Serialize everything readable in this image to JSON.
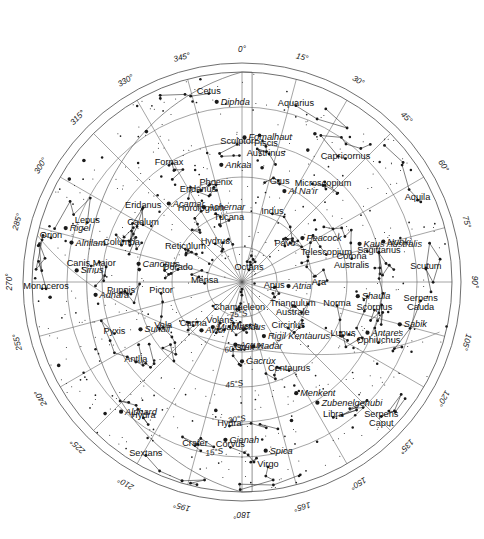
{
  "chart_data": {
    "type": "scatter",
    "projection": "polar-azimuthal-equidistant",
    "center": "South Celestial Pole (Octans)",
    "xlabel": "Right Ascension (degrees)",
    "ylabel": "Declination (degrees South)",
    "grid": true,
    "legend": false,
    "ra_ticks_deg": [
      0,
      15,
      30,
      45,
      60,
      75,
      90,
      105,
      120,
      135,
      150,
      165,
      180,
      195,
      210,
      225,
      240,
      255,
      270,
      285,
      300,
      315,
      330,
      345
    ],
    "ra_tick_labels": [
      "0°",
      "15°",
      "30°",
      "45°",
      "60°",
      "75°",
      "90°",
      "105°",
      "120°",
      "135°",
      "150°",
      "165°",
      "180°",
      "195°",
      "210°",
      "225°",
      "240°",
      "255°",
      "270°",
      "285°",
      "300°",
      "315°",
      "330°",
      "345°"
    ],
    "dec_rings_deg": [
      0,
      15,
      30,
      45,
      60,
      75
    ],
    "dec_tick_labels": [
      "0°",
      "15°S",
      "30°S",
      "45°S",
      "60°S",
      "75°S"
    ],
    "dec_label_positions": [
      {
        "label": "75°S",
        "ra": 185,
        "dec": -75
      },
      {
        "label": "60°S",
        "ra": 187,
        "dec": -60
      },
      {
        "label": "45°S",
        "ra": 184,
        "dec": -45
      },
      {
        "label": "30°S",
        "ra": 182,
        "dec": -30
      },
      {
        "label": "15°S",
        "ra": 189,
        "dec": -15
      }
    ],
    "constellations": [
      {
        "name": "Cetus",
        "ra": 350,
        "dec": -8
      },
      {
        "name": "Sculptor",
        "ra": 358,
        "dec": -31
      },
      {
        "name": "Fornax",
        "ra": 328,
        "dec": -31
      },
      {
        "name": "Eridanus",
        "ra": 307,
        "dec": -37
      },
      {
        "name": "Eridanus",
        "ra": 334,
        "dec": -47
      },
      {
        "name": "Horologium",
        "ra": 330,
        "dec": -55
      },
      {
        "name": "Caelum",
        "ra": 300,
        "dec": -41
      },
      {
        "name": "Lepus",
        "ra": 291,
        "dec": -19
      },
      {
        "name": "Orion",
        "ra": 283,
        "dec": -6
      },
      {
        "name": "Columba",
        "ra": 287,
        "dec": -36
      },
      {
        "name": "Canis Major",
        "ra": 276,
        "dec": -25
      },
      {
        "name": "Monoceros",
        "ra": 268,
        "dec": -6
      },
      {
        "name": "Puppis",
        "ra": 265,
        "dec": -38
      },
      {
        "name": "Pyxis",
        "ra": 248,
        "dec": -31
      },
      {
        "name": "Antlia",
        "ra": 233,
        "dec": -33
      },
      {
        "name": "Hydra",
        "ra": 216,
        "dec": -18
      },
      {
        "name": "Hydra",
        "ra": 185,
        "dec": -28
      },
      {
        "name": "Sextans",
        "ra": 209,
        "dec": -5
      },
      {
        "name": "Crater",
        "ra": 196,
        "dec": -17
      },
      {
        "name": "Corvus",
        "ra": 184,
        "dec": -19
      },
      {
        "name": "Virgo",
        "ra": 172,
        "dec": -10
      },
      {
        "name": "Libra",
        "ra": 146,
        "dec": -20
      },
      {
        "name": "Serpens Caput",
        "ra": 134,
        "dec": -7
      },
      {
        "name": "Ophiuchus",
        "ra": 114,
        "dec": -26
      },
      {
        "name": "Serpens Cauda",
        "ra": 96,
        "dec": -13
      },
      {
        "name": "Scutum",
        "ra": 86,
        "dec": -11
      },
      {
        "name": "Aquila",
        "ra": 65,
        "dec": -7
      },
      {
        "name": "Sagittarius",
        "ra": 78,
        "dec": -30
      },
      {
        "name": "Capricornus",
        "ra": 40,
        "dec": -21
      },
      {
        "name": "Microscopium",
        "ra": 40,
        "dec": -36
      },
      {
        "name": "Aquarius",
        "ra": 17,
        "dec": -11
      },
      {
        "name": "Piscis Austrinus",
        "ra": 10,
        "dec": -31
      },
      {
        "name": "Grus",
        "ra": 21,
        "dec": -45
      },
      {
        "name": "Phoenix",
        "ra": 345,
        "dec": -47
      },
      {
        "name": "Tucana",
        "ra": 348,
        "dec": -63
      },
      {
        "name": "Indus",
        "ra": 24,
        "dec": -58
      },
      {
        "name": "Pavo",
        "ra": 50,
        "dec": -66
      },
      {
        "name": "Telescopium",
        "ra": 72,
        "dec": -52
      },
      {
        "name": "Corona Australis",
        "ra": 78,
        "dec": -42
      },
      {
        "name": "Ara",
        "ra": 92,
        "dec": -57
      },
      {
        "name": "Norma",
        "ra": 104,
        "dec": -48
      },
      {
        "name": "Scorpius",
        "ra": 102,
        "dec": -32
      },
      {
        "name": "Lupus",
        "ra": 118,
        "dec": -41
      },
      {
        "name": "Centaurus",
        "ra": 152,
        "dec": -47
      },
      {
        "name": "Circinus",
        "ra": 135,
        "dec": -62
      },
      {
        "name": "Triangulum Australe",
        "ra": 115,
        "dec": -66
      },
      {
        "name": "Apus",
        "ra": 100,
        "dec": -76
      },
      {
        "name": "Octans",
        "ra": 30,
        "dec": -84
      },
      {
        "name": "Chamaeleon",
        "ra": 186,
        "dec": -78
      },
      {
        "name": "Musca",
        "ra": 176,
        "dec": -70
      },
      {
        "name": "Crux",
        "ra": 178,
        "dec": -61
      },
      {
        "name": "Volans",
        "ra": 208,
        "dec": -70
      },
      {
        "name": "Carina",
        "ra": 228,
        "dec": -62
      },
      {
        "name": "Vela",
        "ra": 240,
        "dec": -51
      },
      {
        "name": "Pictor",
        "ra": 262,
        "dec": -55
      },
      {
        "name": "Dorado",
        "ra": 281,
        "dec": -62
      },
      {
        "name": "Mensa",
        "ra": 268,
        "dec": -74
      },
      {
        "name": "Reticulum",
        "ra": 300,
        "dec": -62
      },
      {
        "name": "Hydrus",
        "ra": 325,
        "dec": -70
      }
    ],
    "named_stars": [
      {
        "name": "Diphda",
        "ra": 352,
        "dec": -12
      },
      {
        "name": "Fomalhaut",
        "ra": 1,
        "dec": -28
      },
      {
        "name": "Ankaa",
        "ra": 350,
        "dec": -39
      },
      {
        "name": "Achernar",
        "ra": 333,
        "dec": -54
      },
      {
        "name": "Acamar",
        "ra": 317,
        "dec": -44
      },
      {
        "name": "Rigel",
        "ra": 287,
        "dec": -11
      },
      {
        "name": "Alnilam",
        "ra": 283,
        "dec": -15
      },
      {
        "name": "Sirius",
        "ra": 274,
        "dec": -19
      },
      {
        "name": "Adhara",
        "ra": 265,
        "dec": -27
      },
      {
        "name": "Canopus",
        "ra": 280,
        "dec": -45
      },
      {
        "name": "Suhail",
        "ra": 245,
        "dec": -42
      },
      {
        "name": "Miaplacidus",
        "ra": 213,
        "dec": -67
      },
      {
        "name": "Avior",
        "ra": 220,
        "dec": -63
      },
      {
        "name": "Acrux",
        "ra": 186,
        "dec": -63
      },
      {
        "name": "Gacrux",
        "ra": 180,
        "dec": -56
      },
      {
        "name": "Hadar",
        "ra": 170,
        "dec": -62
      },
      {
        "name": "Rigil Kentaurus",
        "ra": 158,
        "dec": -65
      },
      {
        "name": "Atria",
        "ra": 95,
        "dec": -70
      },
      {
        "name": "Menkent",
        "ra": 154,
        "dec": -37
      },
      {
        "name": "Zubenelgenubi",
        "ra": 148,
        "dec": -29
      },
      {
        "name": "Spica",
        "ra": 172,
        "dec": -17
      },
      {
        "name": "Gienah",
        "ra": 186,
        "dec": -22
      },
      {
        "name": "Alphard",
        "ra": 223,
        "dec": -14
      },
      {
        "name": "Antares",
        "ra": 112,
        "dec": -32
      },
      {
        "name": "Shaula",
        "ra": 97,
        "dec": -40
      },
      {
        "name": "Sabik",
        "ra": 105,
        "dec": -20
      },
      {
        "name": "Nunki",
        "ra": 74,
        "dec": -27
      },
      {
        "name": "Kaus Australis",
        "ra": 72,
        "dec": -37
      },
      {
        "name": "Peacock",
        "ra": 54,
        "dec": -58
      },
      {
        "name": "Al Na'ir",
        "ra": 25,
        "dec": -47
      }
    ],
    "star_count_visible": 620
  },
  "chart_meta": {
    "hemisphere": "Southern",
    "pole_label": "Octans",
    "degree_symbol": "°"
  }
}
